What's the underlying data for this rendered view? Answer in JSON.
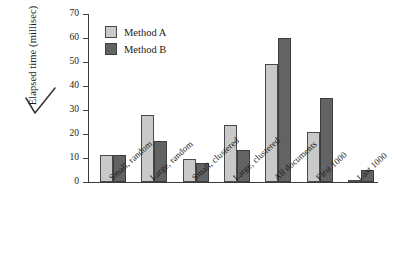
{
  "chart_data": {
    "type": "bar",
    "title": "",
    "xlabel": "",
    "ylabel": "Elapsed time (millisec)",
    "ylim": [
      0,
      70
    ],
    "ytick_step": 10,
    "yticks": [
      70,
      60,
      50,
      40,
      30,
      20,
      10,
      0
    ],
    "grid": false,
    "legend_position": "top-left inside plot",
    "categories": [
      "Small, random",
      "Large, random",
      "Small, clustered",
      "Large, clustered",
      "All documents",
      "First 1000",
      "Last 1000"
    ],
    "series": [
      {
        "name": "Method A",
        "color": "#c9c9c9",
        "values": [
          11.4,
          27.8,
          9.6,
          23.8,
          49.2,
          20.7,
          0.8
        ]
      },
      {
        "name": "Method B",
        "color": "#636363",
        "values": [
          11.4,
          16.9,
          8.1,
          13.2,
          59.8,
          35.0,
          5.0
        ]
      }
    ]
  },
  "annotations": {
    "checkmark": "check-mark"
  }
}
